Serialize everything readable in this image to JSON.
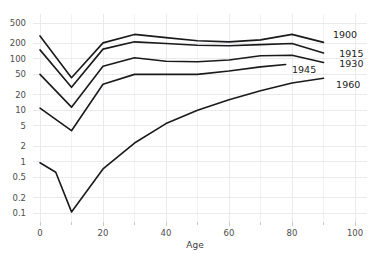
{
  "chart_data": {
    "type": "line",
    "title": "",
    "subtitle": "",
    "xlabel": "Age",
    "ylabel": "",
    "yscale": "log",
    "xlim": [
      -4,
      104
    ],
    "ylim": [
      0.075,
      700
    ],
    "grid": true,
    "legend_position": "right-inline-labels",
    "x_ticks": [
      0,
      20,
      40,
      60,
      80,
      100
    ],
    "x_tick_labels": [
      "0",
      "20",
      "40",
      "60",
      "80",
      "100"
    ],
    "x_minor_ticks": [
      10,
      30,
      50,
      70,
      90
    ],
    "y_ticks": [
      0.1,
      0.2,
      0.5,
      1,
      2,
      5,
      10,
      20,
      50,
      100,
      200,
      500
    ],
    "y_tick_labels": [
      "0.1",
      "0.2",
      "0.5",
      "1",
      "2",
      "5",
      "10",
      "20",
      "50",
      "100",
      "200",
      "500"
    ],
    "series": [
      {
        "name": "1900",
        "label": "1900",
        "label_x": 93,
        "label_y": 300,
        "x": [
          0,
          10,
          20,
          30,
          40,
          50,
          60,
          70,
          80,
          90
        ],
        "y": [
          280,
          43,
          205,
          300,
          260,
          225,
          215,
          235,
          300,
          210
        ]
      },
      {
        "name": "1915",
        "label": "1915",
        "label_x": 95,
        "label_y": 130,
        "x": [
          0,
          10,
          20,
          30,
          40,
          50,
          60,
          70,
          80,
          90
        ],
        "y": [
          150,
          28,
          155,
          215,
          200,
          185,
          180,
          190,
          200,
          130
        ]
      },
      {
        "name": "1930",
        "label": "1930",
        "label_x": 95,
        "label_y": 80,
        "x": [
          0,
          10,
          20,
          30,
          40,
          50,
          60,
          70,
          80,
          90
        ],
        "y": [
          50,
          11.5,
          72,
          105,
          90,
          88,
          95,
          115,
          118,
          85
        ]
      },
      {
        "name": "1945",
        "label": "1945",
        "label_x": 80,
        "label_y": 63,
        "x": [
          0,
          10,
          20,
          30,
          40,
          50,
          60,
          70,
          78
        ],
        "y": [
          11,
          4,
          32,
          50,
          50,
          50,
          58,
          70,
          78
        ]
      },
      {
        "name": "1960",
        "label": "1960",
        "label_x": 94,
        "label_y": 32,
        "x": [
          0,
          5,
          10,
          20,
          30,
          40,
          50,
          60,
          70,
          80,
          90
        ],
        "y": [
          0.95,
          0.62,
          0.105,
          0.72,
          2.3,
          5.5,
          10,
          16,
          24,
          34,
          42
        ]
      }
    ]
  }
}
